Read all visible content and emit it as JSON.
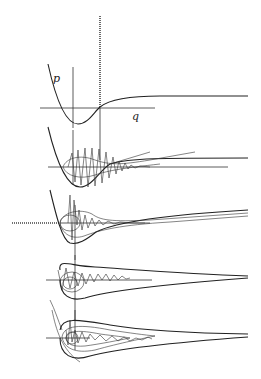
{
  "figure": {
    "labels": {
      "p": "p",
      "q": "q"
    },
    "panels": [
      {
        "id": 1,
        "axis_y": 108,
        "content": "potential curve with dotted vertical spike"
      },
      {
        "id": 2,
        "axis_y": 167,
        "content": "oscillating trajectory with growing amplitude"
      },
      {
        "id": 3,
        "axis_y": 223,
        "content": "damped oscillations and orbit loops"
      },
      {
        "id": 4,
        "axis_y": 280,
        "content": "teardrop orbit with chaotic trajectory"
      },
      {
        "id": 5,
        "axis_y": 338,
        "content": "nested teardrop orbits with trajectory"
      }
    ],
    "colors": {
      "line": "#222222",
      "background": "#ffffff"
    }
  }
}
